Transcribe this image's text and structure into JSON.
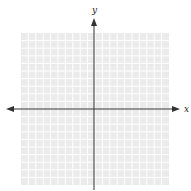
{
  "diagram": {
    "type": "coordinate-plane",
    "grid": {
      "cells_x": 20,
      "cells_y": 20,
      "background_color": "#ebebeb",
      "line_color": "#ffffff",
      "left": 21,
      "top": 33,
      "right": 169,
      "bottom": 185
    },
    "axes": {
      "origin": {
        "x": 94,
        "y": 109
      },
      "color": "#333333",
      "x_axis": {
        "label": "x",
        "from": 6,
        "to": 180,
        "arrows": "both"
      },
      "y_axis": {
        "label": "y",
        "from": 18,
        "to": 190,
        "arrows": "top"
      }
    }
  }
}
